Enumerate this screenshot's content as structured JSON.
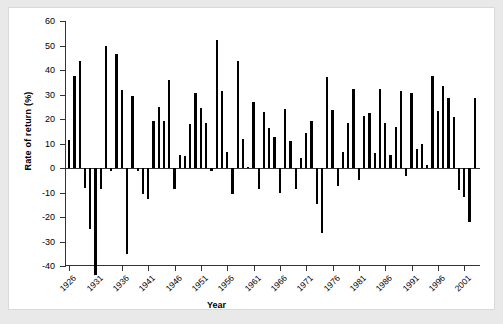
{
  "chart_data": {
    "type": "bar",
    "title": "",
    "xlabel": "Year",
    "ylabel": "Rate of return (%)",
    "ylim": [
      -40,
      60
    ],
    "yticks": [
      -40,
      -30,
      -20,
      -10,
      0,
      10,
      20,
      30,
      40,
      50,
      60
    ],
    "ytick_labels": [
      "-40",
      "-30",
      "-20",
      "-10",
      "0",
      "10",
      "20",
      "30",
      "40",
      "50",
      "60"
    ],
    "xlim": [
      1925.2,
      2004.0
    ],
    "xticks": [
      1926,
      1931,
      1936,
      1941,
      1946,
      1951,
      1956,
      1961,
      1966,
      1971,
      1976,
      1981,
      1986,
      1991,
      1996,
      2001
    ],
    "xtick_labels": [
      "1926",
      "1931",
      "1936",
      "1941",
      "1946",
      "1951",
      "1956",
      "1961",
      "1966",
      "1971",
      "1976",
      "1981",
      "1986",
      "1991",
      "1996",
      "2001"
    ],
    "grid": false,
    "legend": null,
    "bar_color": "#000000",
    "categories": [
      1926,
      1927,
      1928,
      1929,
      1930,
      1931,
      1932,
      1933,
      1934,
      1935,
      1936,
      1937,
      1938,
      1939,
      1940,
      1941,
      1942,
      1943,
      1944,
      1945,
      1946,
      1947,
      1948,
      1949,
      1950,
      1951,
      1952,
      1953,
      1954,
      1955,
      1956,
      1957,
      1958,
      1959,
      1960,
      1961,
      1962,
      1963,
      1964,
      1965,
      1966,
      1967,
      1968,
      1969,
      1970,
      1971,
      1972,
      1973,
      1974,
      1975,
      1976,
      1977,
      1978,
      1979,
      1980,
      1981,
      1982,
      1983,
      1984,
      1985,
      1986,
      1987,
      1988,
      1989,
      1990,
      1991,
      1992,
      1993,
      1994,
      1995,
      1996,
      1997,
      1998,
      1999,
      2000,
      2001,
      2002,
      2003
    ],
    "values": [
      11.6,
      37.5,
      43.8,
      -8.3,
      -25.1,
      -43.8,
      -8.6,
      50.0,
      -1.2,
      46.7,
      31.9,
      -35.3,
      29.3,
      -1.1,
      -10.7,
      -12.8,
      19.2,
      25.1,
      19.0,
      35.8,
      -8.4,
      5.2,
      5.1,
      18.1,
      30.6,
      24.6,
      18.5,
      -1.1,
      52.4,
      31.4,
      6.6,
      -10.5,
      43.7,
      12.0,
      0.5,
      26.9,
      -8.7,
      22.8,
      16.5,
      12.5,
      -10.1,
      24.0,
      11.1,
      -8.5,
      4.0,
      14.3,
      19.0,
      -14.7,
      -26.5,
      37.2,
      23.8,
      -7.2,
      6.6,
      18.4,
      32.4,
      -4.9,
      21.4,
      22.5,
      6.3,
      32.2,
      18.5,
      5.2,
      16.8,
      31.5,
      -3.2,
      30.5,
      7.7,
      10.0,
      1.3,
      37.4,
      23.1,
      33.4,
      28.6,
      21.0,
      -9.1,
      -11.9,
      -22.1,
      28.7
    ]
  },
  "axis": {
    "y_title": "Rate of return (%)",
    "x_title": "Year"
  }
}
